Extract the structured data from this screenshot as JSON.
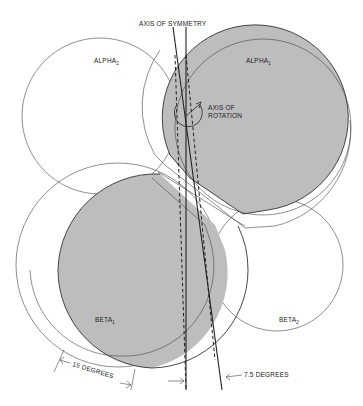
{
  "figure": {
    "title_label": "AXIS OF SYMMETRY",
    "rotation_label_line1": "AXIS OF",
    "rotation_label_line2": "ROTATION",
    "regions": [
      {
        "name": "ALPHA",
        "subscript": "2",
        "fill": "white"
      },
      {
        "name": "ALPHA",
        "subscript": "1",
        "fill": "gray"
      },
      {
        "name": "BETA",
        "subscript": "1",
        "fill": "gray"
      },
      {
        "name": "BETA",
        "subscript": "2",
        "fill": "white"
      }
    ],
    "angle_labels": {
      "left": "15 DEGREES",
      "right": "7.5 DEGREES"
    },
    "colors": {
      "shaded": "#bdbdbd",
      "line": "#333333",
      "background": "#ffffff"
    }
  }
}
